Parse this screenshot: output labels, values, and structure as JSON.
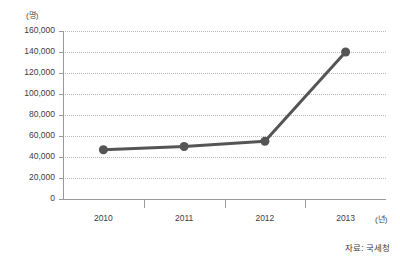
{
  "chart_data": {
    "type": "line",
    "title": "",
    "subtitle": "",
    "xlabel": "",
    "ylabel": "",
    "x_unit": "(년)",
    "y_unit": "(명)",
    "categories": [
      "2010",
      "2011",
      "2012",
      "2013"
    ],
    "series": [
      {
        "name": "",
        "values": [
          47000,
          50000,
          55000,
          140000
        ],
        "color": "#555555",
        "marker": "circle"
      }
    ],
    "ylim": [
      0,
      160000
    ],
    "y_ticks": [
      0,
      20000,
      40000,
      60000,
      80000,
      100000,
      120000,
      140000,
      160000
    ],
    "y_tick_labels": [
      "0",
      "20,000",
      "40,000",
      "60,000",
      "80,000",
      "100,000",
      "120,000",
      "140,000",
      "160,000"
    ],
    "grid": true,
    "grid_style": "dotted-horizontal",
    "legend": false,
    "legend_position": "none",
    "source_note": "자료: 국세청"
  },
  "colors": {
    "series": "#555555",
    "grid": "#b9b9b9",
    "axis": "#9a9a9a",
    "text": "#3d3d3d",
    "background": "#ffffff"
  }
}
